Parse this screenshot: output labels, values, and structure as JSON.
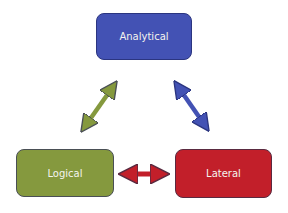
{
  "diagram": {
    "nodes": [
      {
        "id": "analytical",
        "label": "Analytical",
        "color": "#4352b4"
      },
      {
        "id": "logical",
        "label": "Logical",
        "color": "#85993e"
      },
      {
        "id": "lateral",
        "label": "Lateral",
        "color": "#c21f2a"
      }
    ],
    "edges": [
      {
        "from": "logical",
        "to": "analytical",
        "type": "double-arrow",
        "color": "#85993e"
      },
      {
        "from": "analytical",
        "to": "lateral",
        "type": "double-arrow",
        "color": "#4352b4"
      },
      {
        "from": "logical",
        "to": "lateral",
        "type": "double-arrow",
        "color": "#c21f2a"
      }
    ]
  }
}
